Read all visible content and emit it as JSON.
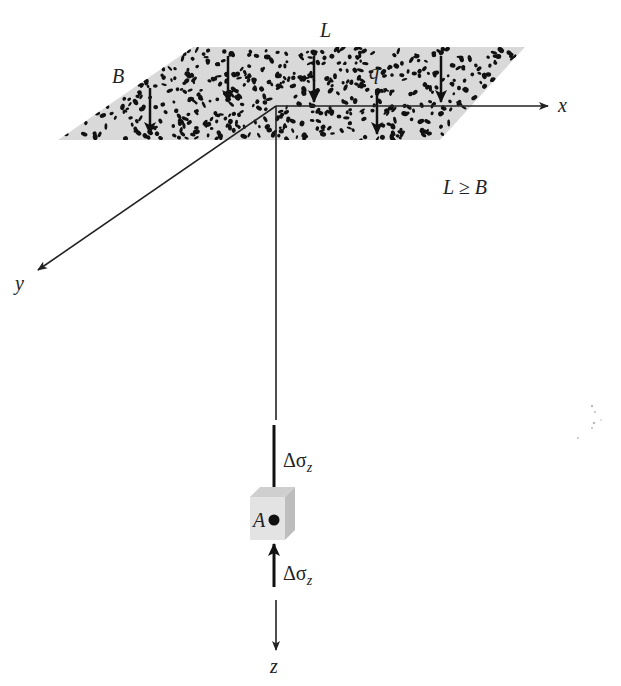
{
  "figure": {
    "labels": {
      "length": "L",
      "width": "B",
      "load": "q",
      "x_axis": "x",
      "y_axis": "y",
      "z_axis": "z",
      "condition": "L ≥ B",
      "point": "A",
      "stress_delta": "Δσ",
      "stress_subscript": "z"
    },
    "colors": {
      "plate_fill": "#d9d9d9",
      "speckle": "#111111",
      "line": "#222222",
      "cube_front": "#e3e3e3",
      "cube_top": "#cfcfcf",
      "cube_side": "#bdbdbd"
    }
  }
}
